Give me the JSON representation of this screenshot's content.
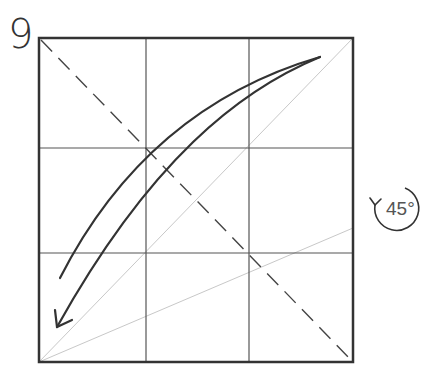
{
  "diagram": {
    "step_number": "9",
    "rotation_label": "45°",
    "colors": {
      "outline": "#333333",
      "grid": "#555555",
      "guide": "#bbbbbb",
      "arrow": "#333333",
      "background": "#ffffff"
    },
    "square": {
      "x": 39,
      "y": 38,
      "size": 315
    },
    "grid_divisions": 3,
    "elements": [
      {
        "type": "square-outline",
        "description": "paper square"
      },
      {
        "type": "grid-lines",
        "description": "3x3 crease grid"
      },
      {
        "type": "valley-fold-line",
        "description": "dashed diagonal from top-left to bottom-right"
      },
      {
        "type": "guide-line",
        "description": "light diagonal from bottom-left to top-right"
      },
      {
        "type": "guide-line",
        "description": "light line from bottom-left corner to right edge at two-thirds height"
      },
      {
        "type": "fold-arrow",
        "description": "curved arrow from top-right swinging down to bottom-left"
      },
      {
        "type": "rotation-symbol",
        "description": "circular arrow indicating rotate 45 degrees"
      }
    ]
  }
}
